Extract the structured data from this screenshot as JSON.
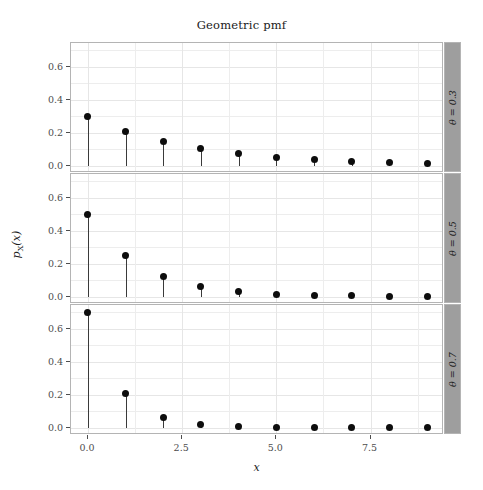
{
  "chart_data": {
    "type": "scatter",
    "title": "Geometric pmf",
    "xlabel": "x",
    "ylabel": "pX(x)",
    "grid": true,
    "legend": "none",
    "facet_direction": "vertical",
    "facet_strip_position": "right",
    "xlim": [
      -0.45,
      9.45
    ],
    "ylim": [
      -0.045,
      0.745
    ],
    "x_ticks": [
      0.0,
      2.5,
      5.0,
      7.5
    ],
    "x_tick_labels": [
      "0.0",
      "2.5",
      "5.0",
      "7.5"
    ],
    "y_ticks": [
      0.0,
      0.2,
      0.4,
      0.6
    ],
    "y_tick_labels": [
      "0.0",
      "0.2",
      "0.4",
      "0.6"
    ],
    "x": [
      0,
      1,
      2,
      3,
      4,
      5,
      6,
      7,
      8,
      9
    ],
    "panels": [
      {
        "strip_label": "θ = 0.3",
        "theta": 0.3,
        "values": [
          0.3,
          0.21,
          0.147,
          0.1029,
          0.072,
          0.0504,
          0.0353,
          0.0247,
          0.0173,
          0.0121
        ]
      },
      {
        "strip_label": "θ = 0.5",
        "theta": 0.5,
        "values": [
          0.5,
          0.25,
          0.125,
          0.0625,
          0.0313,
          0.0156,
          0.0078,
          0.0039,
          0.002,
          0.001
        ]
      },
      {
        "strip_label": "θ = 0.7",
        "theta": 0.7,
        "values": [
          0.7,
          0.21,
          0.063,
          0.0189,
          0.0057,
          0.0017,
          0.0005,
          0.0002,
          0.0,
          0.0
        ]
      }
    ]
  },
  "colors": {
    "point": "#0d0d0d",
    "stem": "#3a3a3a",
    "panel_border": "#b4b4b4",
    "strip_fill": "#9e9e9e",
    "grid": "#ededed",
    "background": "#ffffff",
    "text": "#1a1a1a",
    "axis_text": "#4d4d4d"
  }
}
